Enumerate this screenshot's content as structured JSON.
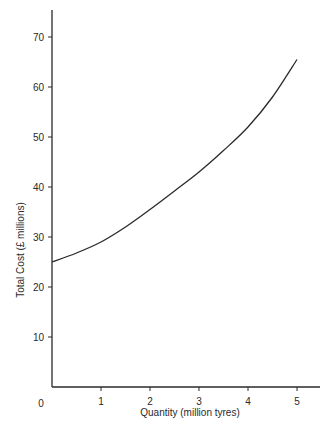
{
  "chart_data": {
    "type": "line",
    "title": "",
    "xlabel": "Quantity (million tyres)",
    "ylabel": "Total Cost (£ millions)",
    "xlim": [
      0,
      5.5
    ],
    "ylim": [
      0,
      75
    ],
    "grid": false,
    "legend": null,
    "x_ticks": [
      1,
      2,
      3,
      4,
      5
    ],
    "y_ticks": [
      10,
      20,
      30,
      40,
      50,
      60,
      70
    ],
    "origin_label": "0",
    "series": [
      {
        "name": "Total Cost",
        "x": [
          0,
          0.5,
          1,
          1.5,
          2,
          2.5,
          3,
          3.5,
          4,
          4.5,
          5
        ],
        "values": [
          25,
          26.8,
          29,
          32,
          35.5,
          39.2,
          43,
          47.3,
          52,
          58,
          65.5
        ]
      }
    ],
    "color": "#2a2a2a"
  }
}
